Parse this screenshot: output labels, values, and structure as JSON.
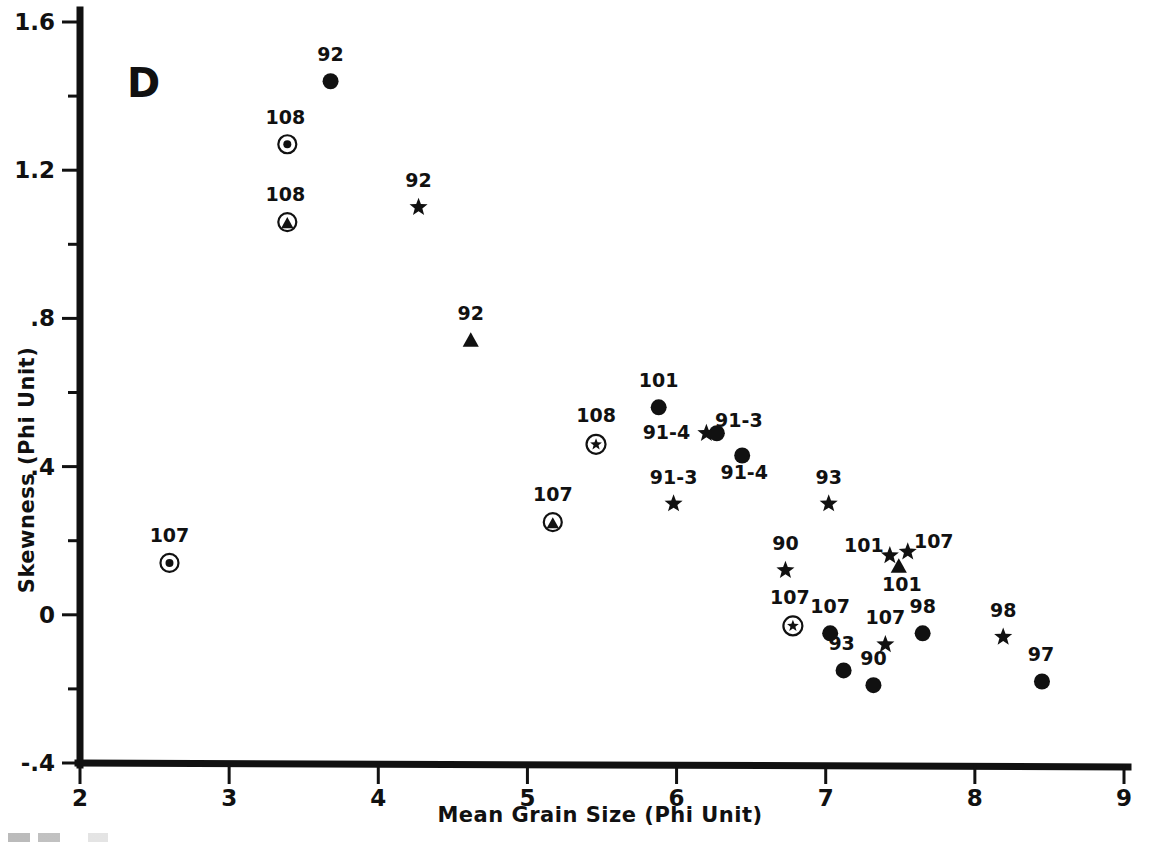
{
  "chart_data": {
    "type": "scatter",
    "title": "",
    "panel_label": "D",
    "xlabel": "Mean Grain Size (Phi Unit)",
    "ylabel": "Skewness (Phi Unit)",
    "xlim": [
      2,
      9
    ],
    "ylim": [
      -0.4,
      1.6
    ],
    "xticks": [
      "2",
      "3",
      "4",
      "5",
      "6",
      "7",
      "8",
      "9"
    ],
    "xtick_values": [
      2,
      3,
      4,
      5,
      6,
      7,
      8,
      9
    ],
    "yticks": [
      "1.6",
      "1.2",
      ".8",
      ".4",
      "0",
      "-.4"
    ],
    "ytick_values": [
      1.6,
      1.2,
      0.8,
      0.4,
      0,
      -0.4
    ],
    "yminor_values": [
      1.4,
      1.0,
      0.6,
      0.2,
      -0.2
    ],
    "grid": false,
    "legend": "none",
    "marker_types": [
      "circle",
      "star",
      "triangle",
      "circle-dot",
      "circle-star",
      "circle-triangle"
    ],
    "points": [
      {
        "label": "92",
        "x": 3.68,
        "y": 1.44,
        "marker": "circle",
        "lx": 0,
        "ly": -20
      },
      {
        "label": "108",
        "x": 3.39,
        "y": 1.27,
        "marker": "circle-dot",
        "lx": -2,
        "ly": -20
      },
      {
        "label": "108",
        "x": 3.39,
        "y": 1.06,
        "marker": "circle-triangle",
        "lx": -2,
        "ly": -21
      },
      {
        "label": "92",
        "x": 4.27,
        "y": 1.1,
        "marker": "star",
        "lx": 0,
        "ly": -20
      },
      {
        "label": "92",
        "x": 4.62,
        "y": 0.74,
        "marker": "triangle",
        "lx": 0,
        "ly": -21
      },
      {
        "label": "101",
        "x": 5.88,
        "y": 0.56,
        "marker": "circle",
        "lx": 0,
        "ly": -20
      },
      {
        "label": "108",
        "x": 5.46,
        "y": 0.46,
        "marker": "circle-star",
        "lx": 0,
        "ly": -22
      },
      {
        "label": "91-4",
        "x": 6.2,
        "y": 0.49,
        "marker": "star",
        "lx": -40,
        "ly": 6
      },
      {
        "label": "91-3",
        "x": 6.27,
        "y": 0.49,
        "marker": "circle",
        "lx": 22,
        "ly": -6
      },
      {
        "label": "91-4",
        "x": 6.44,
        "y": 0.43,
        "marker": "circle",
        "lx": 2,
        "ly": 24
      },
      {
        "label": "91-3",
        "x": 5.98,
        "y": 0.3,
        "marker": "star",
        "lx": 0,
        "ly": -20
      },
      {
        "label": "107",
        "x": 5.17,
        "y": 0.25,
        "marker": "circle-triangle",
        "lx": 0,
        "ly": -21
      },
      {
        "label": "93",
        "x": 7.02,
        "y": 0.3,
        "marker": "star",
        "lx": 0,
        "ly": -20
      },
      {
        "label": "101",
        "x": 7.43,
        "y": 0.16,
        "marker": "star",
        "lx": -26,
        "ly": -4
      },
      {
        "label": "107",
        "x": 7.55,
        "y": 0.17,
        "marker": "star",
        "lx": 26,
        "ly": -4
      },
      {
        "label": "101",
        "x": 7.49,
        "y": 0.13,
        "marker": "triangle",
        "lx": 3,
        "ly": 24
      },
      {
        "label": "107",
        "x": 2.6,
        "y": 0.14,
        "marker": "circle-dot",
        "lx": 0,
        "ly": -21
      },
      {
        "label": "90",
        "x": 6.73,
        "y": 0.12,
        "marker": "star",
        "lx": 0,
        "ly": -20
      },
      {
        "label": "107",
        "x": 6.78,
        "y": -0.03,
        "marker": "circle-star",
        "lx": -3,
        "ly": -22
      },
      {
        "label": "107",
        "x": 7.03,
        "y": -0.05,
        "marker": "circle",
        "lx": 0,
        "ly": -20
      },
      {
        "label": "93",
        "x": 7.12,
        "y": -0.15,
        "marker": "circle",
        "lx": -2,
        "ly": -20
      },
      {
        "label": "90",
        "x": 7.32,
        "y": -0.19,
        "marker": "circle",
        "lx": 0,
        "ly": -20
      },
      {
        "label": "107",
        "x": 7.4,
        "y": -0.08,
        "marker": "star",
        "lx": 0,
        "ly": -20
      },
      {
        "label": "98",
        "x": 7.65,
        "y": -0.05,
        "marker": "circle",
        "lx": 0,
        "ly": -20
      },
      {
        "label": "98",
        "x": 8.19,
        "y": -0.06,
        "marker": "star",
        "lx": 0,
        "ly": -20
      },
      {
        "label": "97",
        "x": 8.45,
        "y": -0.18,
        "marker": "circle",
        "lx": -1,
        "ly": -20
      }
    ]
  },
  "colors": {
    "ink": "#111111",
    "background": "#ffffff"
  }
}
